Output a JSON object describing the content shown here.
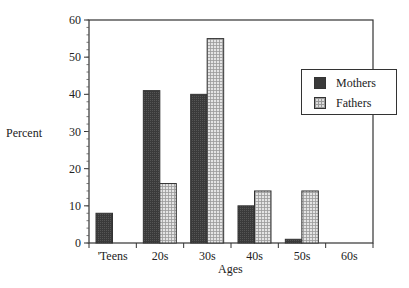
{
  "chart_data": {
    "type": "bar",
    "title": "",
    "xlabel": "Ages",
    "ylabel": "Percent",
    "categories": [
      "'Teens",
      "20s",
      "30s",
      "40s",
      "50s",
      "60s"
    ],
    "series": [
      {
        "name": "Mothers",
        "values": [
          8,
          41,
          40,
          10,
          1,
          0
        ],
        "color": "#3a3a3a"
      },
      {
        "name": "Fathers",
        "values": [
          0,
          16,
          55,
          14,
          14,
          0
        ],
        "color": "#d8d8d8"
      }
    ],
    "ylim": [
      0,
      60
    ],
    "yticks": [
      0,
      10,
      20,
      30,
      40,
      50,
      60
    ],
    "grid": false,
    "legend_position": "right"
  },
  "labels": {
    "ylabel": "Percent",
    "xlabel": "Ages",
    "legend_mothers": "Mothers",
    "legend_fathers": "Fathers"
  }
}
